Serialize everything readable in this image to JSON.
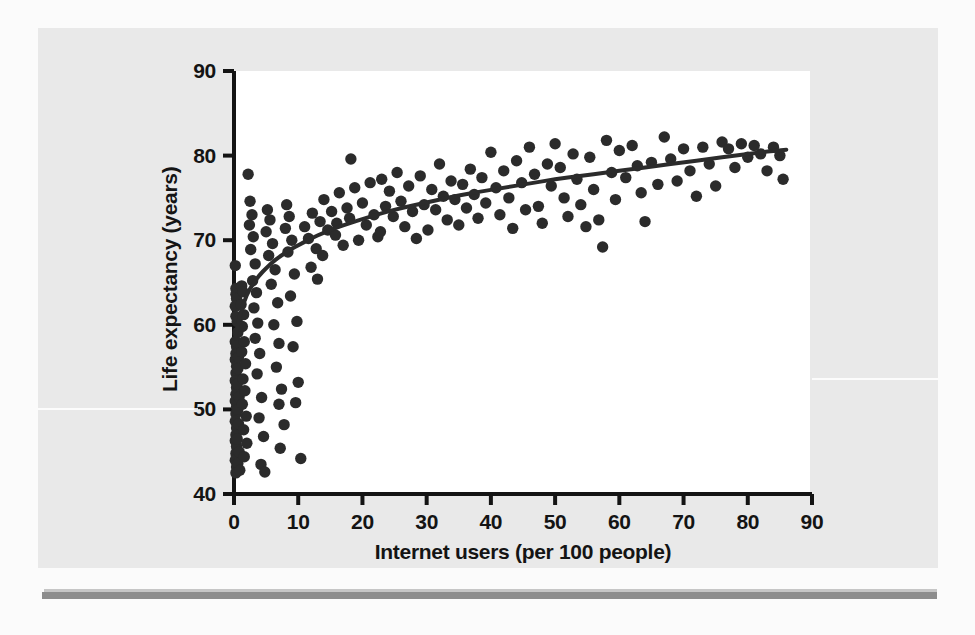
{
  "figure": {
    "background_color": "#fbfbfb",
    "panel_color": "#e9e9e9",
    "plot_background_color": "#ffffff",
    "axis_color": "#141414",
    "point_color": "#2b2b2b",
    "trend_color": "#2b2b2b",
    "rule_color": "#8d8d8d"
  },
  "chart_data": {
    "type": "scatter",
    "title": "",
    "xlabel": "Internet users (per 100 people)",
    "ylabel": "Life expectancy (years)",
    "xlim": [
      0,
      90
    ],
    "ylim": [
      40,
      90
    ],
    "xticks": [
      0,
      10,
      20,
      30,
      40,
      50,
      60,
      70,
      80,
      90
    ],
    "yticks": [
      40,
      50,
      60,
      70,
      80,
      90
    ],
    "xtick_labels": [
      "0",
      "10",
      "20",
      "30",
      "40",
      "50",
      "60",
      "70",
      "80",
      "90"
    ],
    "ytick_labels": [
      "40",
      "50",
      "60",
      "70",
      "80",
      "90"
    ],
    "grid": false,
    "legend": null,
    "marker_size": 7,
    "trend_line": {
      "label": "logarithmic fit",
      "width": 4,
      "points": [
        [
          0.2,
          58.4
        ],
        [
          1,
          61.5
        ],
        [
          2,
          63.6
        ],
        [
          3,
          64.9
        ],
        [
          4,
          65.9
        ],
        [
          5,
          66.7
        ],
        [
          6,
          67.4
        ],
        [
          7,
          68.0
        ],
        [
          8,
          68.5
        ],
        [
          9,
          69.0
        ],
        [
          10,
          69.4
        ],
        [
          12,
          70.2
        ],
        [
          14,
          70.9
        ],
        [
          16,
          71.5
        ],
        [
          18,
          72.0
        ],
        [
          20,
          72.5
        ],
        [
          23,
          73.2
        ],
        [
          26,
          73.8
        ],
        [
          29,
          74.3
        ],
        [
          32,
          74.8
        ],
        [
          35,
          75.3
        ],
        [
          38,
          75.7
        ],
        [
          42,
          76.2
        ],
        [
          46,
          76.7
        ],
        [
          50,
          77.2
        ],
        [
          54,
          77.6
        ],
        [
          58,
          78.0
        ],
        [
          62,
          78.4
        ],
        [
          66,
          78.8
        ],
        [
          70,
          79.2
        ],
        [
          74,
          79.6
        ],
        [
          78,
          80.0
        ],
        [
          82,
          80.4
        ],
        [
          86,
          80.7
        ]
      ]
    },
    "points": [
      [
        0.2,
        67.0
      ],
      [
        0.3,
        64.3
      ],
      [
        0.3,
        63.6
      ],
      [
        0.4,
        63.1
      ],
      [
        0.2,
        62.2
      ],
      [
        0.3,
        61.0
      ],
      [
        0.2,
        58.0
      ],
      [
        0.4,
        57.4
      ],
      [
        0.3,
        56.6
      ],
      [
        0.2,
        55.9
      ],
      [
        0.4,
        55.1
      ],
      [
        0.3,
        54.3
      ],
      [
        0.2,
        53.4
      ],
      [
        0.4,
        52.6
      ],
      [
        0.3,
        51.8
      ],
      [
        0.2,
        51.0
      ],
      [
        0.4,
        50.3
      ],
      [
        0.3,
        49.5
      ],
      [
        0.2,
        48.6
      ],
      [
        0.4,
        47.8
      ],
      [
        0.3,
        47.0
      ],
      [
        0.2,
        46.3
      ],
      [
        0.4,
        45.6
      ],
      [
        0.3,
        44.8
      ],
      [
        0.2,
        44.0
      ],
      [
        0.4,
        43.2
      ],
      [
        0.3,
        42.5
      ],
      [
        0.5,
        60.4
      ],
      [
        0.6,
        59.1
      ],
      [
        0.5,
        57.9
      ],
      [
        0.7,
        56.2
      ],
      [
        0.6,
        54.8
      ],
      [
        0.5,
        53.0
      ],
      [
        0.8,
        51.5
      ],
      [
        0.6,
        50.0
      ],
      [
        0.7,
        48.3
      ],
      [
        0.5,
        46.5
      ],
      [
        0.8,
        45.0
      ],
      [
        0.6,
        43.6
      ],
      [
        0.9,
        42.8
      ],
      [
        1.2,
        64.6
      ],
      [
        1.4,
        63.9
      ],
      [
        1.1,
        62.4
      ],
      [
        1.5,
        61.2
      ],
      [
        1.3,
        59.8
      ],
      [
        1.6,
        58.0
      ],
      [
        1.2,
        56.8
      ],
      [
        1.8,
        55.4
      ],
      [
        1.4,
        53.6
      ],
      [
        1.7,
        52.2
      ],
      [
        1.3,
        50.6
      ],
      [
        1.9,
        49.2
      ],
      [
        1.5,
        47.6
      ],
      [
        2.0,
        46.0
      ],
      [
        1.6,
        44.4
      ],
      [
        2.2,
        77.8
      ],
      [
        2.5,
        74.6
      ],
      [
        2.8,
        73.0
      ],
      [
        2.4,
        71.8
      ],
      [
        3.0,
        70.4
      ],
      [
        2.6,
        68.9
      ],
      [
        3.3,
        67.2
      ],
      [
        2.9,
        65.2
      ],
      [
        3.5,
        63.8
      ],
      [
        3.1,
        62.0
      ],
      [
        3.7,
        60.2
      ],
      [
        3.3,
        58.4
      ],
      [
        4.0,
        56.6
      ],
      [
        3.6,
        54.2
      ],
      [
        4.3,
        51.4
      ],
      [
        3.9,
        49.0
      ],
      [
        4.6,
        46.8
      ],
      [
        4.2,
        43.5
      ],
      [
        4.8,
        42.6
      ],
      [
        5.2,
        73.6
      ],
      [
        5.6,
        72.4
      ],
      [
        5.0,
        71.0
      ],
      [
        6.0,
        69.6
      ],
      [
        5.4,
        68.2
      ],
      [
        6.4,
        66.5
      ],
      [
        5.8,
        64.8
      ],
      [
        6.8,
        62.6
      ],
      [
        6.2,
        60.0
      ],
      [
        7.0,
        57.8
      ],
      [
        6.6,
        55.0
      ],
      [
        7.4,
        52.4
      ],
      [
        7.0,
        50.6
      ],
      [
        7.8,
        48.2
      ],
      [
        7.2,
        45.4
      ],
      [
        8.2,
        74.2
      ],
      [
        8.6,
        72.8
      ],
      [
        8.0,
        71.4
      ],
      [
        9.0,
        70.0
      ],
      [
        8.4,
        68.6
      ],
      [
        9.4,
        66.0
      ],
      [
        8.8,
        63.4
      ],
      [
        9.8,
        60.4
      ],
      [
        9.2,
        57.4
      ],
      [
        10.0,
        53.2
      ],
      [
        9.6,
        50.8
      ],
      [
        10.4,
        44.2
      ],
      [
        11.0,
        71.6
      ],
      [
        11.6,
        70.2
      ],
      [
        12.2,
        73.2
      ],
      [
        12.8,
        69.0
      ],
      [
        13.4,
        72.2
      ],
      [
        12.0,
        66.8
      ],
      [
        13.0,
        65.4
      ],
      [
        14.0,
        74.8
      ],
      [
        14.6,
        71.2
      ],
      [
        13.8,
        68.2
      ],
      [
        15.2,
        73.4
      ],
      [
        15.8,
        70.6
      ],
      [
        16.4,
        75.6
      ],
      [
        16.0,
        72.0
      ],
      [
        17.0,
        69.4
      ],
      [
        17.6,
        73.8
      ],
      [
        18.2,
        79.6
      ],
      [
        18.8,
        76.2
      ],
      [
        18.0,
        72.6
      ],
      [
        19.4,
        70.0
      ],
      [
        20.0,
        74.4
      ],
      [
        20.6,
        71.8
      ],
      [
        21.2,
        76.8
      ],
      [
        21.8,
        73.0
      ],
      [
        22.4,
        70.4
      ],
      [
        23.0,
        77.2
      ],
      [
        23.6,
        74.0
      ],
      [
        22.8,
        71.0
      ],
      [
        24.2,
        75.8
      ],
      [
        24.8,
        72.8
      ],
      [
        25.4,
        78.0
      ],
      [
        26.0,
        74.6
      ],
      [
        26.6,
        71.6
      ],
      [
        27.2,
        76.4
      ],
      [
        27.8,
        73.4
      ],
      [
        28.4,
        70.2
      ],
      [
        29.0,
        77.6
      ],
      [
        29.6,
        74.2
      ],
      [
        30.2,
        71.2
      ],
      [
        30.8,
        76.0
      ],
      [
        31.4,
        73.6
      ],
      [
        32.0,
        79.0
      ],
      [
        32.6,
        75.2
      ],
      [
        33.2,
        72.4
      ],
      [
        33.8,
        77.0
      ],
      [
        34.4,
        74.8
      ],
      [
        35.0,
        71.8
      ],
      [
        35.6,
        76.6
      ],
      [
        36.2,
        73.8
      ],
      [
        36.8,
        78.4
      ],
      [
        37.4,
        75.4
      ],
      [
        38.0,
        72.6
      ],
      [
        38.6,
        77.4
      ],
      [
        39.2,
        74.4
      ],
      [
        40.0,
        80.4
      ],
      [
        40.8,
        76.2
      ],
      [
        41.4,
        73.0
      ],
      [
        42.0,
        78.2
      ],
      [
        42.8,
        75.0
      ],
      [
        43.4,
        71.4
      ],
      [
        44.0,
        79.4
      ],
      [
        44.8,
        76.8
      ],
      [
        45.4,
        73.6
      ],
      [
        46.0,
        81.0
      ],
      [
        46.8,
        77.8
      ],
      [
        47.4,
        74.0
      ],
      [
        48.0,
        72.0
      ],
      [
        48.8,
        79.0
      ],
      [
        49.4,
        76.4
      ],
      [
        50.0,
        81.4
      ],
      [
        50.8,
        78.6
      ],
      [
        51.4,
        75.0
      ],
      [
        52.0,
        72.8
      ],
      [
        52.8,
        80.2
      ],
      [
        53.4,
        77.2
      ],
      [
        54.0,
        74.2
      ],
      [
        54.8,
        71.6
      ],
      [
        55.4,
        79.8
      ],
      [
        56.0,
        76.0
      ],
      [
        56.8,
        72.4
      ],
      [
        57.4,
        69.2
      ],
      [
        58.0,
        81.8
      ],
      [
        58.8,
        78.0
      ],
      [
        59.4,
        74.8
      ],
      [
        60.0,
        80.6
      ],
      [
        61.0,
        77.4
      ],
      [
        62.0,
        81.2
      ],
      [
        62.8,
        78.8
      ],
      [
        63.4,
        75.6
      ],
      [
        64.0,
        72.2
      ],
      [
        65.0,
        79.2
      ],
      [
        66.0,
        76.6
      ],
      [
        67.0,
        82.2
      ],
      [
        68.0,
        79.6
      ],
      [
        69.0,
        77.0
      ],
      [
        70.0,
        80.8
      ],
      [
        71.0,
        78.2
      ],
      [
        72.0,
        75.2
      ],
      [
        73.0,
        81.0
      ],
      [
        74.0,
        79.0
      ],
      [
        75.0,
        76.4
      ],
      [
        76.0,
        81.6
      ],
      [
        77.0,
        80.8
      ],
      [
        78.0,
        78.6
      ],
      [
        79.0,
        81.4
      ],
      [
        80.0,
        79.8
      ],
      [
        81.0,
        81.2
      ],
      [
        82.0,
        80.2
      ],
      [
        83.0,
        78.2
      ],
      [
        84.0,
        81.0
      ],
      [
        85.0,
        80.0
      ],
      [
        85.5,
        77.2
      ]
    ]
  }
}
